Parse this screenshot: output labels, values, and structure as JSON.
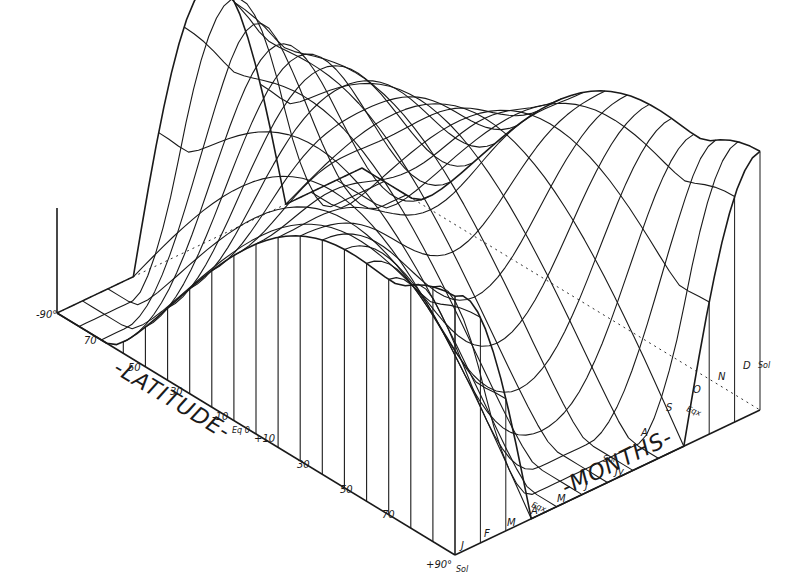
{
  "chart_data": {
    "type": "surface",
    "title": "",
    "xlabel": "-LATITUDE-",
    "ylabel": "-MONTHS-",
    "latitude_ticks": [
      "-90°",
      "70",
      "50",
      "30",
      "-10",
      "Eq 0",
      "+10",
      "30",
      "50",
      "70",
      "+90°"
    ],
    "latitude_values": [
      -90,
      -70,
      -50,
      -30,
      -10,
      0,
      10,
      30,
      50,
      70,
      90
    ],
    "month_ticks": [
      "J",
      "F",
      "M",
      "A",
      "M",
      "J",
      "Jy",
      "A",
      "S",
      "O",
      "N",
      "D"
    ],
    "month_markers": [
      {
        "label": "Sol",
        "position": "start"
      },
      {
        "label": "Eqx",
        "position": "M"
      },
      {
        "label": "Sol",
        "position": "J"
      },
      {
        "label": "Eqx",
        "position": "S"
      },
      {
        "label": "Sol",
        "position": "D"
      }
    ],
    "grid": true
  },
  "labels": {
    "latitude_title": "-LATITUDE-",
    "months_title": "-MONTHS-",
    "lat_start": "-90°",
    "lat_end": "+90°",
    "sol1": "Sol",
    "eqx1": "Eqx.",
    "sol2": "Sol",
    "eqx2": "Eqx",
    "sol3": "Sol",
    "lat": [
      "70",
      "50",
      "30",
      "-10",
      "Eq 0",
      "+10",
      "30",
      "50",
      "70"
    ],
    "months": [
      "J",
      "F",
      "M",
      "A",
      "M",
      "J",
      "Jy",
      "A",
      "S",
      "O",
      "N",
      "D"
    ]
  }
}
